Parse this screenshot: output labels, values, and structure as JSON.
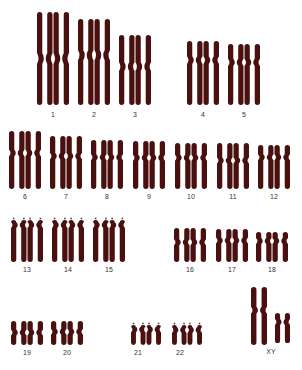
{
  "color": "#4a0f0f",
  "chromosomes": [
    {
      "label": "1",
      "x": 37,
      "top": 12,
      "bottom": 105,
      "w": 32,
      "cen": 0.5,
      "type": "meta",
      "lx": 53,
      "ly": 111
    },
    {
      "label": "2",
      "x": 78,
      "top": 19,
      "bottom": 105,
      "w": 32,
      "cen": 0.42,
      "type": "meta",
      "lx": 94,
      "ly": 111
    },
    {
      "label": "3",
      "x": 119,
      "top": 35,
      "bottom": 105,
      "w": 32,
      "cen": 0.45,
      "type": "meta",
      "lx": 135,
      "ly": 111
    },
    {
      "label": "4",
      "x": 187,
      "top": 41,
      "bottom": 105,
      "w": 32,
      "cen": 0.3,
      "type": "meta",
      "lx": 203,
      "ly": 111
    },
    {
      "label": "5",
      "x": 228,
      "top": 44,
      "bottom": 105,
      "w": 32,
      "cen": 0.3,
      "type": "meta",
      "lx": 244,
      "ly": 111
    },
    {
      "label": "6",
      "x": 9,
      "top": 131,
      "bottom": 189,
      "w": 32,
      "cen": 0.38,
      "type": "meta",
      "lx": 25,
      "ly": 193
    },
    {
      "label": "7",
      "x": 50,
      "top": 136,
      "bottom": 189,
      "w": 32,
      "cen": 0.38,
      "type": "meta",
      "lx": 66,
      "ly": 193
    },
    {
      "label": "8",
      "x": 91,
      "top": 140,
      "bottom": 189,
      "w": 32,
      "cen": 0.35,
      "type": "meta",
      "lx": 107,
      "ly": 193
    },
    {
      "label": "9",
      "x": 133,
      "top": 141,
      "bottom": 189,
      "w": 32,
      "cen": 0.35,
      "type": "meta",
      "lx": 149,
      "ly": 193
    },
    {
      "label": "10",
      "x": 175,
      "top": 143,
      "bottom": 189,
      "w": 32,
      "cen": 0.32,
      "type": "meta",
      "lx": 191,
      "ly": 193
    },
    {
      "label": "11",
      "x": 217,
      "top": 143,
      "bottom": 189,
      "w": 32,
      "cen": 0.38,
      "type": "meta",
      "lx": 233,
      "ly": 193
    },
    {
      "label": "12",
      "x": 258,
      "top": 145,
      "bottom": 189,
      "w": 32,
      "cen": 0.28,
      "type": "meta",
      "lx": 274,
      "ly": 193
    },
    {
      "label": "13",
      "x": 11,
      "top": 220,
      "bottom": 262,
      "w": 32,
      "cen": 0.12,
      "type": "acro",
      "lx": 27,
      "ly": 266
    },
    {
      "label": "14",
      "x": 52,
      "top": 220,
      "bottom": 262,
      "w": 32,
      "cen": 0.12,
      "type": "acro",
      "lx": 68,
      "ly": 266
    },
    {
      "label": "15",
      "x": 93,
      "top": 220,
      "bottom": 262,
      "w": 32,
      "cen": 0.12,
      "type": "acro",
      "lx": 109,
      "ly": 266
    },
    {
      "label": "16",
      "x": 174,
      "top": 228,
      "bottom": 262,
      "w": 32,
      "cen": 0.42,
      "type": "meta",
      "lx": 190,
      "ly": 266
    },
    {
      "label": "17",
      "x": 216,
      "top": 229,
      "bottom": 262,
      "w": 32,
      "cen": 0.35,
      "type": "meta",
      "lx": 232,
      "ly": 266
    },
    {
      "label": "18",
      "x": 256,
      "top": 232,
      "bottom": 262,
      "w": 32,
      "cen": 0.3,
      "type": "meta",
      "lx": 272,
      "ly": 266
    },
    {
      "label": "19",
      "x": 11,
      "top": 321,
      "bottom": 345,
      "w": 32,
      "cen": 0.48,
      "type": "meta",
      "lx": 27,
      "ly": 349
    },
    {
      "label": "20",
      "x": 51,
      "top": 321,
      "bottom": 345,
      "w": 32,
      "cen": 0.45,
      "type": "meta",
      "lx": 67,
      "ly": 349
    },
    {
      "label": "21",
      "x": 131,
      "top": 325,
      "bottom": 345,
      "w": 30,
      "cen": 0.22,
      "type": "acro",
      "lx": 138,
      "ly": 349
    },
    {
      "label": "22",
      "x": 172,
      "top": 325,
      "bottom": 345,
      "w": 30,
      "cen": 0.25,
      "type": "acro",
      "lx": 180,
      "ly": 349
    }
  ],
  "sex": {
    "label": "XY",
    "lx": 271,
    "ly": 348,
    "x": {
      "x": 251,
      "top": 287,
      "bottom": 345,
      "w": 16,
      "cen": 0.4
    },
    "y": {
      "x": 275,
      "top": 313,
      "bottom": 343,
      "w": 15,
      "cen": 0.3
    }
  }
}
